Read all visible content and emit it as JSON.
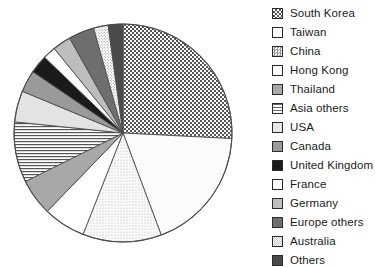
{
  "chart_data": {
    "type": "pie",
    "title": "",
    "unit": "percent",
    "legend_position": "right",
    "start_angle_deg": 0,
    "direction": "clockwise",
    "categories": [
      "South Korea",
      "Taiwan",
      "China",
      "Hong Kong",
      "Thailand",
      "Asia others",
      "USA",
      "Canada",
      "United Kingdom",
      "France",
      "Germany",
      "Europe others",
      "Australia",
      "Others"
    ],
    "values": [
      26.4,
      18.9,
      11.9,
      6.4,
      5.6,
      9.2,
      4.7,
      3.3,
      2.8,
      1.9,
      2.8,
      3.9,
      2.2,
      2.2
    ],
    "angles_deg": [
      95,
      68,
      43,
      23,
      20,
      33,
      17,
      12,
      10,
      7,
      10,
      14,
      8,
      8
    ],
    "patterns": [
      "checkerboard",
      "solid",
      "fine-checker",
      "solid",
      "solid",
      "horizontal-lines",
      "solid",
      "solid",
      "solid",
      "solid",
      "solid",
      "solid",
      "stipple",
      "solid"
    ],
    "colors": [
      "#f2f2f2",
      "#fbfbfb",
      "#ededed",
      "#ffffff",
      "#a8a8a8",
      "#f4f4f4",
      "#e3e3e3",
      "#9a9a9a",
      "#1a1a1a",
      "#ffffff",
      "#bdbdbd",
      "#6e6e6e",
      "#dcdcdc",
      "#4a4a4a"
    ],
    "outline_color": "#4d4d4d"
  },
  "legend": {
    "items": [
      {
        "label": "South Korea",
        "swatch": "swatch-checkerboard"
      },
      {
        "label": "Taiwan",
        "swatch": "swatch-white"
      },
      {
        "label": "China",
        "swatch": "swatch-fine-checker"
      },
      {
        "label": "Hong Kong",
        "swatch": "swatch-white"
      },
      {
        "label": "Thailand",
        "swatch": "swatch-mid-gray"
      },
      {
        "label": "Asia others",
        "swatch": "swatch-horizontal-lines"
      },
      {
        "label": "USA",
        "swatch": "swatch-light-gray"
      },
      {
        "label": "Canada",
        "swatch": "swatch-gray"
      },
      {
        "label": "United Kingdom",
        "swatch": "swatch-black"
      },
      {
        "label": "France",
        "swatch": "swatch-white"
      },
      {
        "label": "Germany",
        "swatch": "swatch-silver"
      },
      {
        "label": "Europe others",
        "swatch": "swatch-dark-gray"
      },
      {
        "label": "Australia",
        "swatch": "swatch-stipple"
      },
      {
        "label": "Others",
        "swatch": "swatch-charcoal"
      }
    ]
  }
}
